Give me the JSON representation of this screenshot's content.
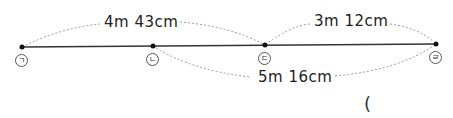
{
  "diagram": {
    "points": [
      {
        "label": "ㄱ",
        "x": 22
      },
      {
        "label": "ㄴ",
        "x": 153
      },
      {
        "label": "ㄷ",
        "x": 265
      },
      {
        "label": "ㄹ",
        "x": 436
      }
    ],
    "distances": [
      {
        "from": "ㄱ",
        "to": "ㄷ",
        "text": "4m 43cm"
      },
      {
        "from": "ㄷ",
        "to": "ㄹ",
        "text": "3m 12cm"
      },
      {
        "from": "ㄴ",
        "to": "ㄹ",
        "text": "5m 16cm"
      }
    ],
    "answer_paren": "("
  }
}
